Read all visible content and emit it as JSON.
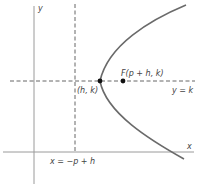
{
  "figure": {
    "labels": {
      "y_axis": "y",
      "x_axis": "x",
      "vertex": "(h, k)",
      "focus": "F(p + h, k)",
      "axis_of_symmetry": "y = k",
      "directrix": "x = −p + h"
    },
    "colors": {
      "axes": "#9a9a9a",
      "dashed": "#555555",
      "parabola": "#6a6a6a",
      "points": "#111111",
      "text": "#444444"
    },
    "elements": [
      {
        "type": "axis",
        "name": "x-axis"
      },
      {
        "type": "axis",
        "name": "y-axis"
      },
      {
        "type": "dashed-line",
        "name": "directrix",
        "equation": "x = −p + h"
      },
      {
        "type": "dashed-line",
        "name": "axis-of-symmetry",
        "equation": "y = k"
      },
      {
        "type": "curve",
        "name": "parabola",
        "opens": "right"
      },
      {
        "type": "point",
        "name": "vertex",
        "label": "(h, k)"
      },
      {
        "type": "point",
        "name": "focus",
        "label": "F(p + h, k)"
      }
    ]
  }
}
